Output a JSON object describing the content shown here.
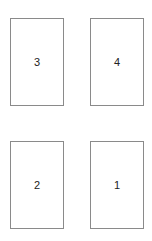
{
  "diagram": {
    "boxes": [
      {
        "label": "3",
        "x": 10,
        "y": 18,
        "w": 54,
        "h": 88
      },
      {
        "label": "4",
        "x": 90,
        "y": 18,
        "w": 54,
        "h": 88
      },
      {
        "label": "2",
        "x": 10,
        "y": 141,
        "w": 54,
        "h": 88
      },
      {
        "label": "1",
        "x": 90,
        "y": 141,
        "w": 54,
        "h": 88
      }
    ],
    "border_color": "#8a8a8a"
  }
}
